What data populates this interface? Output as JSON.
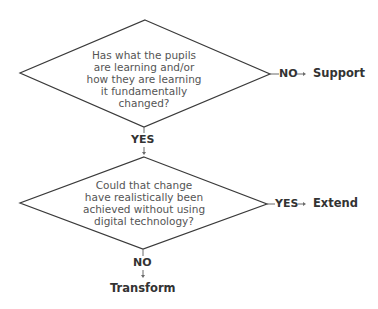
{
  "diagram": {
    "type": "flowchart",
    "decisions": [
      {
        "id": "q1",
        "lines": [
          "Has what the pupils",
          "are learning and/or",
          "how they are learning",
          "it fundamentally",
          "changed?"
        ],
        "right_branch": {
          "label": "NO",
          "outcome": "Support"
        },
        "down_branch": {
          "label": "YES"
        }
      },
      {
        "id": "q2",
        "lines": [
          "Could that change",
          "have realistically been",
          "achieved without using",
          "digital technology?"
        ],
        "right_branch": {
          "label": "YES",
          "outcome": "Extend"
        },
        "down_branch": {
          "label": "NO",
          "outcome": "Transform"
        }
      }
    ]
  },
  "colors": {
    "shape_stroke": "#3a3a3a",
    "question_text": "#555555",
    "label_text": "#333333",
    "background": "#ffffff"
  }
}
